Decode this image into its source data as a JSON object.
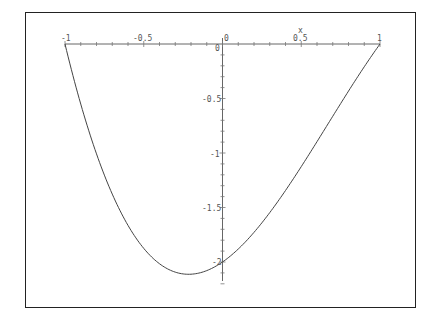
{
  "chart_data": {
    "type": "line",
    "title": "",
    "xlabel": "x",
    "ylabel": "",
    "function": "(x^2 - 1)(2 - x)",
    "xlim": [
      -1,
      1
    ],
    "ylim": [
      -2.15,
      0
    ],
    "grid": false,
    "legend": null,
    "x_ticks": [
      "-1",
      "-0.5",
      "0",
      "0.5",
      "1"
    ],
    "y_ticks": [
      "0",
      "-0.5",
      "-1",
      "-1.5",
      "-2"
    ],
    "series": [
      {
        "name": "f(x)",
        "color": "#444444",
        "x": [
          -1,
          -0.9,
          -0.8,
          -0.7,
          -0.6,
          -0.5,
          -0.4,
          -0.3,
          -0.2,
          -0.1,
          0,
          0.1,
          0.2,
          0.3,
          0.4,
          0.5,
          0.6,
          0.7,
          0.8,
          0.9,
          1
        ],
        "y": [
          0,
          -0.551,
          -1.008,
          -1.377,
          -1.664,
          -1.875,
          -2.016,
          -2.093,
          -2.112,
          -2.079,
          -2.0,
          -1.881,
          -1.728,
          -1.547,
          -1.344,
          -1.125,
          -0.896,
          -0.663,
          -0.432,
          -0.209,
          0
        ]
      }
    ]
  },
  "labels": {
    "x_axis_name": "x",
    "x_neg1": "-1",
    "x_neg05": "-0.5",
    "x_0": "0",
    "x_05": "0.5",
    "x_1": "1",
    "origin": "0",
    "y_neg05": "-0.5",
    "y_neg1": "-1",
    "y_neg15": "-1.5",
    "y_neg2": "-2"
  }
}
